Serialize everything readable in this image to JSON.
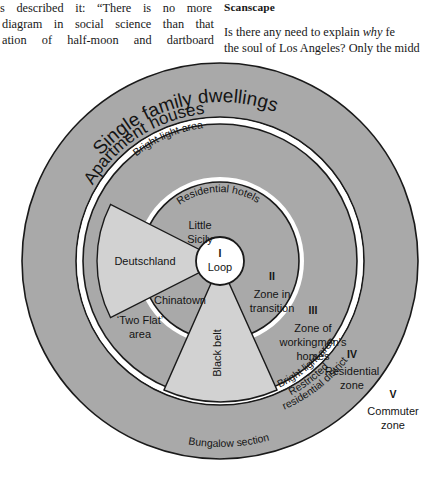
{
  "page": {
    "width": 442,
    "height": 495,
    "background": "#ffffff"
  },
  "body_text": {
    "left_column": {
      "clipped_top_fragment": "",
      "lines": [
        "s described it: “There is no more",
        "diagram in social science than that",
        "ation of half-moon and dartboard"
      ]
    },
    "right_column": {
      "heading": "Scanscape",
      "lines": [
        "Is there any need to explain why fe",
        "the soul of Los Angeles? Only the midd"
      ],
      "italic_word": "why"
    }
  },
  "diagram": {
    "colors": {
      "ring_fill": "#a9a9a9",
      "ring_fill_alt": "#a6a6a6",
      "wedge_fill": "#d2d2d2",
      "center_fill": "#ffffff",
      "gap_fill": "#ffffff",
      "stroke": "#1a1a1a",
      "text": "#141414"
    },
    "geometry": {
      "center_x": 220,
      "center_y": 203,
      "loop_radius": 24,
      "zone2_outer_radius": 79,
      "zone3_outer_radius": 137,
      "zone4_inner_radius": 137,
      "ring_outer_radius": 198,
      "ring_inner_radius": 144
    },
    "zones": [
      {
        "numeral": "I",
        "name": "Loop"
      },
      {
        "numeral": "II",
        "name_line1": "Zone in",
        "name_line2": "transition"
      },
      {
        "numeral": "III",
        "name_line1": "Zone of",
        "name_line2": "workingmen's",
        "name_line3": "homes"
      },
      {
        "numeral": "IV",
        "name_line1": "Residential",
        "name_line2": "zone"
      },
      {
        "numeral": "V",
        "name_line1": "Commuter",
        "name_line2": "zone"
      }
    ],
    "inner_labels": [
      {
        "id": "little-sicily",
        "line1": "Little",
        "line2": "Sicily"
      },
      {
        "id": "deutschland",
        "line1": "Deutschland"
      },
      {
        "id": "chinatown",
        "line1": "Chinatown"
      },
      {
        "id": "black-belt",
        "line1": "Black belt"
      },
      {
        "id": "two-flat-area",
        "line1": "‘Two Flat’",
        "line2": "area"
      }
    ],
    "curved_labels": [
      {
        "id": "single-family-dwellings",
        "text": "Single family dwellings"
      },
      {
        "id": "apartment-houses",
        "text": "Apartment houses"
      },
      {
        "id": "bright-light-area-top",
        "text": "Bright light area"
      },
      {
        "id": "residential-hotels",
        "text": "Residential hotels"
      },
      {
        "id": "bright-light-area-bottom",
        "text": "Bright light area"
      },
      {
        "id": "restricted-residential-district-l1",
        "text": "Restricted"
      },
      {
        "id": "restricted-residential-district-l2",
        "text": "residential district"
      },
      {
        "id": "bungalow-section",
        "text": "Bungalow section"
      }
    ]
  }
}
